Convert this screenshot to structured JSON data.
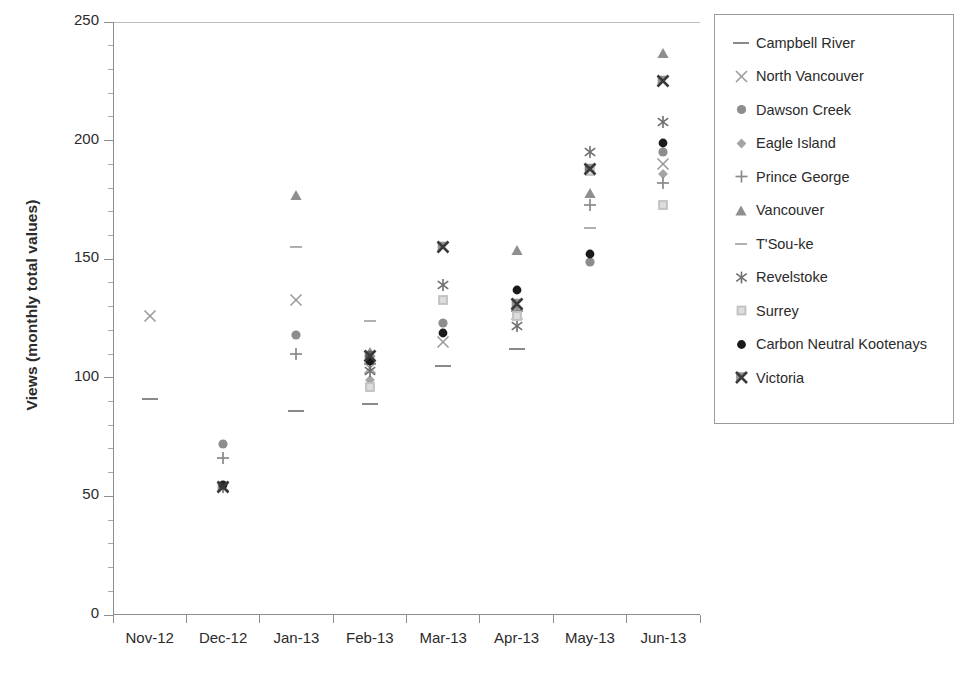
{
  "chart_data": {
    "type": "scatter",
    "title": "",
    "xlabel": "",
    "ylabel": "Views (monthly total values)",
    "categories": [
      "Nov-12",
      "Dec-12",
      "Jan-13",
      "Feb-13",
      "Mar-13",
      "Apr-13",
      "May-13",
      "Jun-13"
    ],
    "ylim": [
      0,
      250
    ],
    "ytick_labels": [
      "0",
      "50",
      "100",
      "150",
      "200",
      "250"
    ],
    "ytick_values": [
      0,
      50,
      100,
      150,
      200,
      250
    ],
    "ytick_minor_step": 10,
    "grid": false,
    "legend_position": "right",
    "series": [
      {
        "name": "Campbell River",
        "marker": "dash",
        "color": "#8a8a8a",
        "values": [
          91,
          null,
          86,
          89,
          105,
          112,
          null,
          null
        ]
      },
      {
        "name": "North Vancouver",
        "marker": "x",
        "color": "#9b9b9b",
        "values": [
          126,
          null,
          133,
          104,
          115,
          127,
          null,
          190
        ]
      },
      {
        "name": "Dawson Creek",
        "marker": "circle-gray",
        "color": "#8d8d8d",
        "values": [
          null,
          72,
          118,
          108,
          123,
          128,
          149,
          195
        ]
      },
      {
        "name": "Eagle Island",
        "marker": "diamond",
        "color": "#a5a5a5",
        "values": [
          null,
          null,
          null,
          99,
          null,
          128,
          null,
          186
        ]
      },
      {
        "name": "Prince George",
        "marker": "plus",
        "color": "#8a8a8a",
        "values": [
          null,
          66,
          110,
          106,
          null,
          128,
          173,
          182
        ]
      },
      {
        "name": "Vancouver",
        "marker": "triangle",
        "color": "#8f8f8f",
        "values": [
          null,
          null,
          177,
          111,
          null,
          154,
          178,
          237
        ]
      },
      {
        "name": "T'Sou-ke",
        "marker": "dash-short",
        "color": "#9d9d9d",
        "values": [
          null,
          null,
          155,
          124,
          null,
          null,
          163,
          null
        ]
      },
      {
        "name": "Revelstoke",
        "marker": "asterisk",
        "color": "#6f6f6f",
        "values": [
          null,
          54,
          null,
          103,
          139,
          122,
          195,
          208
        ]
      },
      {
        "name": "Surrey",
        "marker": "square",
        "color": "#c2c2c2",
        "values": [
          null,
          null,
          null,
          96,
          133,
          126,
          187,
          173
        ]
      },
      {
        "name": "Carbon Neutral Kootenays",
        "marker": "circle-black",
        "color": "#1a1a1a",
        "values": [
          null,
          55,
          null,
          107,
          119,
          137,
          152,
          199
        ]
      },
      {
        "name": "Victoria",
        "marker": "bowtie",
        "color": "#3a3a3a",
        "values": [
          null,
          54,
          null,
          109,
          155,
          131,
          188,
          225
        ]
      }
    ]
  },
  "legend": {
    "items": [
      {
        "label": "Campbell River",
        "icon": "dash-marker-icon"
      },
      {
        "label": "North Vancouver",
        "icon": "x-marker-icon"
      },
      {
        "label": "Dawson Creek",
        "icon": "circle-gray-marker-icon"
      },
      {
        "label": "Eagle Island",
        "icon": "diamond-marker-icon"
      },
      {
        "label": "Prince George",
        "icon": "plus-marker-icon"
      },
      {
        "label": "Vancouver",
        "icon": "triangle-marker-icon"
      },
      {
        "label": "T'Sou-ke",
        "icon": "dash-short-marker-icon"
      },
      {
        "label": "Revelstoke",
        "icon": "asterisk-marker-icon"
      },
      {
        "label": "Surrey",
        "icon": "square-marker-icon"
      },
      {
        "label": "Carbon Neutral Kootenays",
        "icon": "circle-black-marker-icon"
      },
      {
        "label": "Victoria",
        "icon": "bowtie-marker-icon"
      }
    ]
  }
}
